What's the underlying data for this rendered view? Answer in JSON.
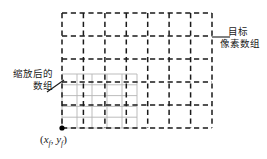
{
  "figure": {
    "title_alt": "",
    "background": "#ffffff",
    "target_grid": {
      "label_line1": "目标",
      "label_line2": "像素数组",
      "style": "dashed",
      "color": "#1a1a1a",
      "columns": 7,
      "rows": 5,
      "x_left": 62,
      "x_right": 212,
      "y_top": 13,
      "y_bottom": 128
    },
    "scaled_grid": {
      "label_line1": "缩放后的",
      "label_line2": "数组",
      "style": "solid-thin",
      "color": "#b6b6b6",
      "columns": 5,
      "rows": 5,
      "x_left": 62,
      "x_right": 137,
      "y_top": 74,
      "y_bottom": 128
    },
    "origin_point": {
      "label": "(x_f, y_f)",
      "x_var": "x",
      "x_sub": "f",
      "y_var": "y",
      "y_sub": "f",
      "dot_x": 62,
      "dot_y": 128,
      "dot_color": "#000000"
    },
    "leader_lines": {
      "target_leader_color": "#1a1a1a",
      "scaled_leader_color": "#1a1a1a"
    }
  }
}
